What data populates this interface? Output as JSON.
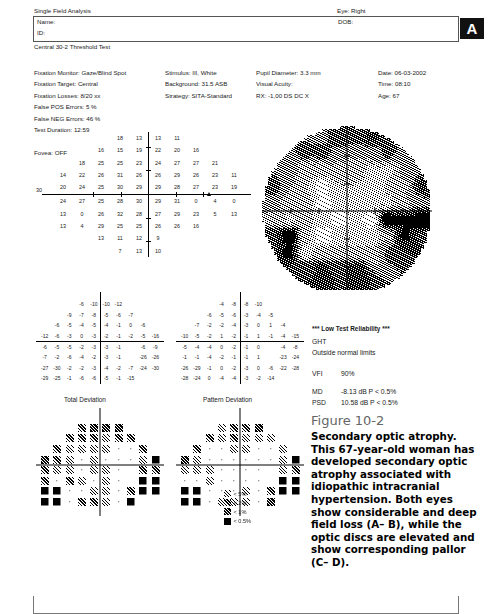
{
  "header": {
    "title": "Single Field Analysis",
    "eye": "Eye: Right",
    "name_label": "Name:",
    "id_label": "ID:",
    "dob_label": "DOB:",
    "test_type": "Central 30-2 Threshold Test",
    "panel_letter": "A"
  },
  "params": {
    "col1": [
      "Fixation Monitor: Gaze/Blind Spot",
      "Fixation Target: Central",
      "Fixation Losses: 8/20 xx",
      "False POS Errors:  5 %",
      "False NEG Errors: 46 %",
      "Test Duration: 12:59",
      "",
      "Fovea: OFF"
    ],
    "col2": [
      "Stimulus: III, White",
      "Background: 31.5 ASB",
      "Strategy: SITA-Standard"
    ],
    "col3": [
      "Pupil Diameter: 3.3 mm",
      "Visual Acuity:",
      "RX: -1,00 DS     DC  X"
    ],
    "col4": [
      "Date: 06-03-2002",
      "Time: 08:10",
      "Age: 67"
    ]
  },
  "indices": {
    "reliability": "*** Low Test Reliability ***",
    "ght_label": "GHT",
    "ght_value": "Outside normal limits",
    "vfi_label": "VFI",
    "vfi_value": "90%",
    "md_label": "MD",
    "md_value": "-8.13 dB  P < 0.5%",
    "psd_label": "PSD",
    "psd_value": "10.58 dB  P < 0.5%"
  },
  "deviation_captions": {
    "total": "Total Deviation",
    "pattern": "Pattern Deviation"
  },
  "probability_legend": [
    {
      "label": "< 5%",
      "level": 1
    },
    {
      "label": "< 2%",
      "level": 2
    },
    {
      "label": "< 1%",
      "level": 3
    },
    {
      "label": "< 0.5%",
      "level": 4
    }
  ],
  "figure": {
    "number": "Figure 10-2",
    "caption": "Secondary optic atrophy. This 67-year-old woman has developed secondary optic atrophy associated with idiopathic intracranial hypertension. Both eyes show considerable and deep field loss (A– B), while the optic discs are elevated and show corresponding pallor (C– D)."
  },
  "chart_data": {
    "type": "table",
    "note": "Humphrey 30-2 grid. Rows top→bottom are superior→inferior field; null entries are outside the test pattern.",
    "threshold_db": {
      "label": "Numeric sensitivity values (dB)",
      "rows": [
        [
          null,
          null,
          null,
          18,
          13,
          13,
          11,
          null,
          null,
          null
        ],
        [
          null,
          null,
          16,
          15,
          19,
          22,
          20,
          16,
          null,
          null
        ],
        [
          null,
          18,
          25,
          25,
          23,
          24,
          27,
          27,
          21,
          null
        ],
        [
          14,
          22,
          26,
          31,
          26,
          26,
          29,
          26,
          23,
          11
        ],
        [
          20,
          24,
          25,
          30,
          29,
          29,
          28,
          27,
          23,
          19
        ],
        [
          24,
          27,
          25,
          28,
          30,
          29,
          31,
          0,
          4,
          0
        ],
        [
          13,
          0,
          26,
          32,
          28,
          27,
          29,
          23,
          5,
          13
        ],
        [
          13,
          4,
          29,
          25,
          25,
          26,
          26,
          16,
          null,
          null
        ],
        [
          null,
          null,
          13,
          11,
          12,
          9,
          null,
          null,
          null,
          null
        ],
        [
          null,
          null,
          null,
          7,
          13,
          10,
          null,
          null,
          null,
          null
        ]
      ],
      "left_edge_label": "30",
      "blind_spot_marker": "△"
    },
    "total_deviation_db": {
      "label": "Total Deviation (dB)",
      "rows": [
        [
          null,
          null,
          null,
          -6,
          -10,
          -10,
          -12,
          null,
          null,
          null
        ],
        [
          null,
          null,
          -9,
          -7,
          -8,
          -5,
          -6,
          -7,
          null,
          null
        ],
        [
          null,
          -6,
          -5,
          -4,
          -5,
          -4,
          -1,
          0,
          -6,
          null
        ],
        [
          -12,
          -6,
          -3,
          0,
          -3,
          -2,
          -1,
          -2,
          -5,
          -16
        ],
        [
          -6,
          -5,
          -5,
          -2,
          -3,
          -3,
          -1,
          null,
          -6,
          -9
        ],
        [
          -7,
          -2,
          -6,
          -4,
          -2,
          -3,
          -1,
          null,
          -26,
          -26
        ],
        [
          -27,
          -30,
          -2,
          -2,
          -3,
          -4,
          -2,
          -7,
          -24,
          -30
        ],
        [
          -29,
          -25,
          -1,
          -6,
          -6,
          -5,
          -1,
          -15,
          null,
          null
        ]
      ]
    },
    "pattern_deviation_db": {
      "label": "Pattern Deviation (dB)",
      "rows": [
        [
          null,
          null,
          null,
          -4,
          -8,
          -8,
          -10,
          null,
          null,
          null
        ],
        [
          null,
          null,
          -6,
          -5,
          -6,
          -3,
          -4,
          -5,
          null,
          null
        ],
        [
          null,
          -7,
          -2,
          -2,
          -4,
          -3,
          0,
          1,
          -4,
          null
        ],
        [
          -10,
          -5,
          -2,
          1,
          -2,
          -1,
          1,
          -1,
          -4,
          -15
        ],
        [
          -5,
          -4,
          -4,
          0,
          -2,
          -1,
          0,
          null,
          -4,
          -8
        ],
        [
          -1,
          -1,
          -4,
          -2,
          -1,
          -1,
          1,
          null,
          -23,
          -24
        ],
        [
          -26,
          -29,
          -1,
          0,
          -2,
          -3,
          0,
          -6,
          -22,
          -28
        ],
        [
          -28,
          -24,
          0,
          -4,
          -4,
          -3,
          -2,
          -14,
          null,
          null
        ]
      ]
    }
  }
}
